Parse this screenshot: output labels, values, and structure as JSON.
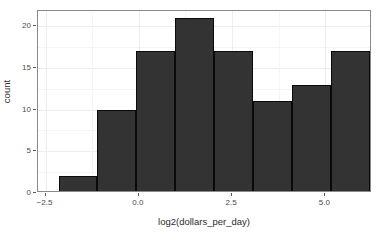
{
  "chart_data": {
    "type": "bar",
    "title": "",
    "subtitle": "",
    "xlabel": "log2(dollars_per_day)",
    "ylabel": "count",
    "grid": true,
    "legend": "none",
    "xlim": [
      -2.7,
      6.25
    ],
    "ylim": [
      0,
      21.8
    ],
    "x_ticks": [
      {
        "value": -2.5,
        "label": "−2.5"
      },
      {
        "value": 0.0,
        "label": "0.0"
      },
      {
        "value": 2.5,
        "label": "2.5"
      },
      {
        "value": 5.0,
        "label": "5.0"
      }
    ],
    "y_ticks": [
      {
        "value": 0,
        "label": "0"
      },
      {
        "value": 5,
        "label": "5"
      },
      {
        "value": 10,
        "label": "10"
      },
      {
        "value": 15,
        "label": "15"
      },
      {
        "value": 20,
        "label": "20"
      }
    ],
    "bin_width": 1.0417,
    "bins": [
      {
        "x_start": -2.15,
        "x_end": -1.11,
        "value": 2
      },
      {
        "x_start": -1.11,
        "x_end": -0.07,
        "value": 10
      },
      {
        "x_start": -0.07,
        "x_end": 0.98,
        "value": 17
      },
      {
        "x_start": 0.98,
        "x_end": 2.02,
        "value": 21
      },
      {
        "x_start": 2.02,
        "x_end": 3.06,
        "value": 17
      },
      {
        "x_start": 3.06,
        "x_end": 4.1,
        "value": 11
      },
      {
        "x_start": 4.1,
        "x_end": 5.14,
        "value": 13
      },
      {
        "x_start": 5.14,
        "x_end": 6.19,
        "value": 17
      },
      {
        "x_start": 6.19,
        "x_end": 7.23,
        "value": 5
      }
    ],
    "categories": [
      "-2.15",
      "-1.11",
      "-0.07",
      "0.98",
      "2.02",
      "3.06",
      "4.10",
      "5.14",
      "6.19"
    ],
    "values": [
      2,
      10,
      17,
      21,
      17,
      11,
      13,
      17,
      5
    ],
    "colors": {
      "bar_fill": "#333333",
      "bar_border": "#0a0a0a",
      "panel_background": "#ffffff",
      "panel_border": "#8a8a8a",
      "gridline_major": "#ededed",
      "gridline_minor": "#f5f5f5",
      "axis_text": "#4d4d4d",
      "axis_title": "#2b2b2b"
    }
  }
}
